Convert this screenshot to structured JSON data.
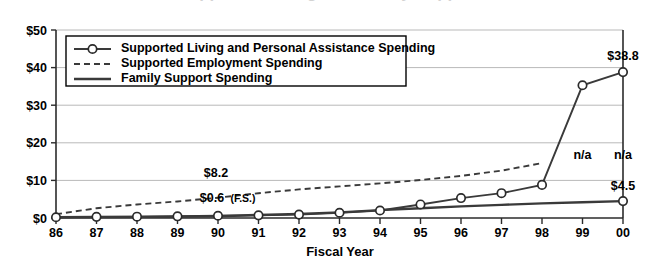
{
  "chart_data": {
    "type": "line",
    "title": "Supported Living and Family Support",
    "xlabel": "Fiscal Year",
    "ylabel": "",
    "categories": [
      "86",
      "87",
      "88",
      "89",
      "90",
      "91",
      "92",
      "93",
      "94",
      "95",
      "96",
      "97",
      "98",
      "99",
      "00"
    ],
    "ylim": [
      0,
      50
    ],
    "yticks": [
      0,
      10,
      20,
      30,
      40,
      50
    ],
    "ytick_labels": [
      "$0",
      "$10",
      "$20",
      "$30",
      "$40",
      "$50"
    ],
    "grid": true,
    "legend_position": "top-left",
    "series": [
      {
        "name": "Supported Living and Personal Assistance Spending",
        "style": "solid-marker",
        "values": [
          0.2,
          0.3,
          0.35,
          0.45,
          0.6,
          0.7,
          0.9,
          1.4,
          2.0,
          3.6,
          5.3,
          6.6,
          8.8,
          35.3,
          38.8
        ]
      },
      {
        "name": "Supported Employment Spending",
        "style": "dashed",
        "values": [
          1.0,
          2.6,
          3.6,
          4.4,
          5.4,
          6.6,
          7.6,
          8.4,
          9.2,
          10.1,
          11.2,
          12.6,
          14.6,
          null,
          null
        ]
      },
      {
        "name": "Family Support Spending",
        "style": "solid-thick",
        "values": [
          0.2,
          0.25,
          0.3,
          0.35,
          0.45,
          0.8,
          1.1,
          1.5,
          2.1,
          2.6,
          3.1,
          3.5,
          3.9,
          4.2,
          4.5
        ]
      }
    ],
    "annotations": [
      {
        "id": "sl-90",
        "text": "$8.2",
        "sub": "",
        "x_index": 4,
        "value": 8.2,
        "dx": -2,
        "dy": -10,
        "anchor": "middle"
      },
      {
        "id": "fs-90",
        "text": "$0.6",
        "sub": "(F.S.)",
        "x_index": 4,
        "value": 0.6,
        "dx": -6,
        "dy": -14,
        "anchor": "middle"
      },
      {
        "id": "sl-00",
        "text": "$38.8",
        "sub": "",
        "x_index": 14,
        "value": 38.8,
        "dx": 0,
        "dy": -12,
        "anchor": "middle"
      },
      {
        "id": "fs-00",
        "text": "$4.5",
        "sub": "",
        "x_index": 14,
        "value": 4.5,
        "dx": 0,
        "dy": -11,
        "anchor": "middle"
      },
      {
        "id": "se-99",
        "text": "n/a",
        "sub": "",
        "x_index": 13,
        "value": 15.8,
        "dx": 0,
        "dy": 0,
        "anchor": "middle"
      },
      {
        "id": "se-00",
        "text": "n/a",
        "sub": "",
        "x_index": 14,
        "value": 15.8,
        "dx": 0,
        "dy": 0,
        "anchor": "middle"
      }
    ],
    "colors": {
      "line": "#3a3a3a",
      "axis": "#2b2b2b",
      "grid": "#b9b9b9",
      "marker_fill": "#ffffff",
      "background": "#ffffff"
    }
  },
  "legend": {
    "items": [
      {
        "label": "Supported Living and Personal Assistance Spending",
        "style": "solid-marker"
      },
      {
        "label": "Supported Employment Spending",
        "style": "dashed"
      },
      {
        "label": "Family Support Spending",
        "style": "solid-thick"
      }
    ]
  }
}
